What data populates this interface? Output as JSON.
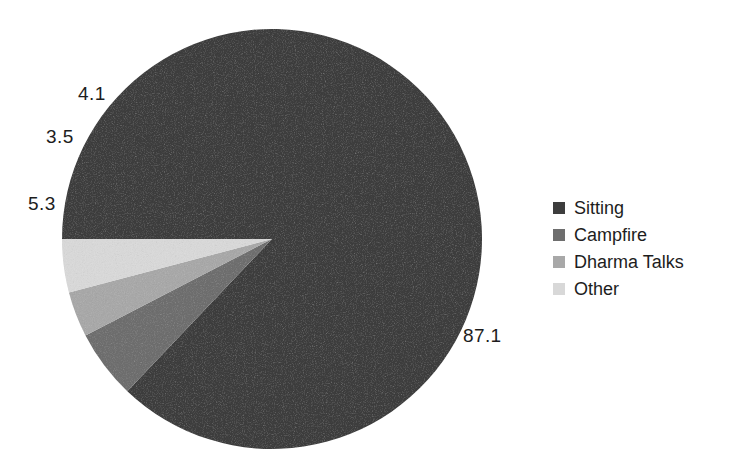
{
  "chart_data": {
    "type": "pie",
    "title": "",
    "subtitle": "",
    "xlabel": "",
    "ylabel": "",
    "grid": false,
    "legend_position": "right",
    "units": "percent",
    "start_angle_deg": 180,
    "direction": "clockwise",
    "categories": [
      "Sitting",
      "Campfire",
      "Dharma Talks",
      "Other"
    ],
    "values": [
      87.1,
      5.3,
      3.5,
      4.1
    ],
    "slices": [
      {
        "label": "Sitting",
        "value": 87.1,
        "value_text": "87.1",
        "color": "#3d3d3d",
        "label_x": 463,
        "label_y": 326
      },
      {
        "label": "Campfire",
        "value": 5.3,
        "value_text": "5.3",
        "color": "#6e6e6e",
        "label_x": 28,
        "label_y": 194
      },
      {
        "label": "Dharma Talks",
        "value": 3.5,
        "value_text": "3.5",
        "color": "#a8a8a8",
        "label_x": 46,
        "label_y": 127
      },
      {
        "label": "Other",
        "value": 4.1,
        "value_text": "4.1",
        "color": "#d8d8d8",
        "label_x": 78,
        "label_y": 84
      }
    ],
    "geometry": {
      "center_x": 272,
      "center_y": 239,
      "radius": 210
    }
  },
  "legend": {
    "items": [
      {
        "label": "Sitting",
        "color": "#3d3d3d"
      },
      {
        "label": "Campfire",
        "color": "#6e6e6e"
      },
      {
        "label": "Dharma Talks",
        "color": "#a8a8a8"
      },
      {
        "label": "Other",
        "color": "#d8d8d8"
      }
    ]
  },
  "colors": {
    "background": "#ffffff",
    "text": "#1d1d1d",
    "sitting": "#3d3d3d",
    "campfire": "#6e6e6e",
    "dharma_talks": "#a8a8a8",
    "other": "#d8d8d8"
  }
}
